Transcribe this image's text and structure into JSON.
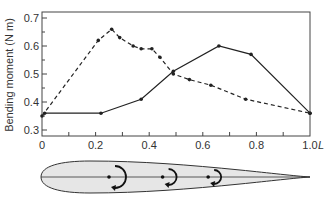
{
  "chart_data": {
    "type": "line",
    "title": "",
    "xlabel": "L",
    "ylabel": "Bending moment (N m)",
    "xlim": [
      0,
      1.0
    ],
    "ylim": [
      0.3,
      0.72
    ],
    "x_ticks": [
      "0",
      "0.2",
      "0.4",
      "0.6",
      "0.8",
      "1.0"
    ],
    "y_ticks": [
      "0.3",
      "0.4",
      "0.5",
      "0.6",
      "0.7"
    ],
    "grid": false,
    "legend": null,
    "series": [
      {
        "name": "solid",
        "style": "solid",
        "x": [
          0.01,
          0.22,
          0.37,
          0.49,
          0.66,
          0.78,
          1.0
        ],
        "y": [
          0.36,
          0.36,
          0.41,
          0.51,
          0.6,
          0.57,
          0.36
        ]
      },
      {
        "name": "dashed",
        "style": "dashed",
        "x": [
          0.0,
          0.21,
          0.26,
          0.29,
          0.34,
          0.37,
          0.41,
          0.44,
          0.49,
          0.55,
          0.63,
          0.76,
          1.0
        ],
        "y": [
          0.35,
          0.62,
          0.66,
          0.63,
          0.6,
          0.59,
          0.59,
          0.56,
          0.5,
          0.48,
          0.46,
          0.41,
          0.36
        ]
      }
    ],
    "annotations": [
      "fish-body outline with three bending-moment arrows along the midline"
    ]
  },
  "labels": {
    "ylabel": "Bending moment (N m)",
    "xlabel": "L"
  },
  "diagram": {
    "moment_positions": [
      0.25,
      0.45,
      0.62
    ]
  }
}
